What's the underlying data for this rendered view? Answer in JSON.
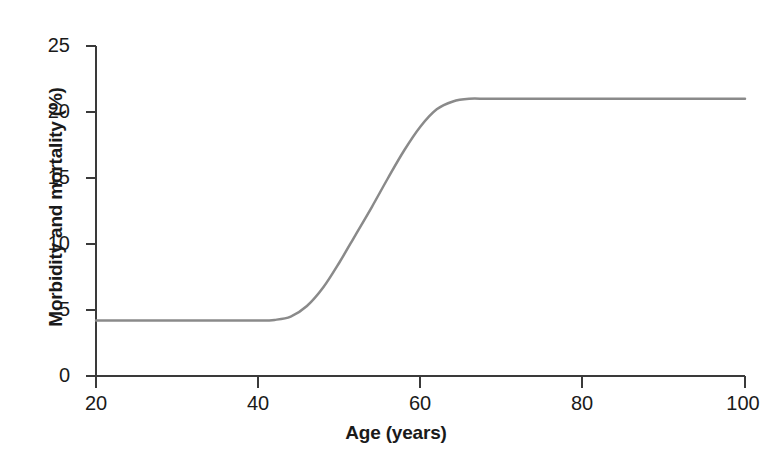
{
  "chart_data": {
    "type": "line",
    "title": "",
    "subtitle": "",
    "xlabel": "Age (years)",
    "ylabel": "Morbidity and mortality (%)",
    "xlim": [
      20,
      100
    ],
    "ylim": [
      0,
      25
    ],
    "xticks": [
      20,
      40,
      60,
      80,
      100
    ],
    "yticks": [
      0,
      5,
      10,
      15,
      20,
      25
    ],
    "xtick_labels": [
      "20",
      "40",
      "60",
      "80",
      "100"
    ],
    "ytick_labels": [
      "0",
      "5",
      "10",
      "15",
      "20",
      "25"
    ],
    "grid": false,
    "legend": null,
    "legend_position": "none",
    "annotations": [],
    "series": [
      {
        "name": "Morbidity and mortality",
        "color": "#8a8a8a",
        "line_width": 2.5,
        "description": "Sigmoid curve: flat near 4.2% until about age 44, steep rise through an inflection near age 54, plateau near 21% from about age 64 onward",
        "x": [
          20,
          22,
          24,
          26,
          28,
          30,
          32,
          34,
          36,
          38,
          40,
          42,
          44,
          46,
          48,
          50,
          52,
          54,
          56,
          58,
          60,
          62,
          64,
          66,
          68,
          70,
          72,
          74,
          76,
          78,
          80,
          82,
          84,
          86,
          88,
          90,
          92,
          94,
          96,
          98,
          100
        ],
        "y": [
          4.2,
          4.2,
          4.2,
          4.2,
          4.2,
          4.2,
          4.2,
          4.2,
          4.2,
          4.2,
          4.2,
          4.25,
          4.5,
          5.3,
          6.7,
          8.6,
          10.7,
          12.8,
          15.0,
          17.1,
          18.9,
          20.2,
          20.8,
          21.0,
          21.0,
          21.0,
          21.0,
          21.0,
          21.0,
          21.0,
          21.0,
          21.0,
          21.0,
          21.0,
          21.0,
          21.0,
          21.0,
          21.0,
          21.0,
          21.0,
          21.0
        ]
      }
    ]
  },
  "axes": {
    "axis_color": "#3a3a3a",
    "tick_color": "#3a3a3a",
    "label_color": "#1a1a1a"
  }
}
